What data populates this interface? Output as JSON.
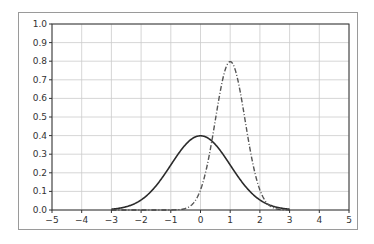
{
  "chart_data": {
    "type": "line",
    "title": "",
    "xlabel": "",
    "ylabel": "",
    "xlim": [
      -5,
      5
    ],
    "ylim": [
      0.0,
      1.0
    ],
    "grid": true,
    "legend": null,
    "xticks": [
      -5,
      -4,
      -3,
      -2,
      -1,
      0,
      1,
      2,
      3,
      4,
      5
    ],
    "yticks": [
      0.0,
      0.1,
      0.2,
      0.3,
      0.4,
      0.5,
      0.6,
      0.7,
      0.8,
      0.9,
      1.0
    ],
    "xtick_labels": [
      "−5",
      "−4",
      "−3",
      "−2",
      "−1",
      "0",
      "1",
      "2",
      "3",
      "4",
      "5"
    ],
    "ytick_labels": [
      "0.0",
      "0.1",
      "0.2",
      "0.3",
      "0.4",
      "0.5",
      "0.6",
      "0.7",
      "0.8",
      "0.9",
      "1.0"
    ],
    "x": [
      -3.0,
      -2.5,
      -2.0,
      -1.5,
      -1.0,
      -0.5,
      0.0,
      0.25,
      0.5,
      0.75,
      1.0,
      1.25,
      1.5,
      2.0,
      2.5,
      3.0
    ],
    "series": [
      {
        "name": "normal(0,1)",
        "style": "solid",
        "color": "#2b2b2b",
        "values": [
          0.004,
          0.018,
          0.054,
          0.13,
          0.242,
          0.352,
          0.399,
          0.387,
          0.352,
          0.301,
          0.242,
          0.183,
          0.13,
          0.054,
          0.018,
          0.004
        ]
      },
      {
        "name": "normal(1,0.5)",
        "style": "dashdot",
        "color": "#555555",
        "values": [
          0.0,
          0.0,
          0.0,
          0.0,
          0.003,
          0.009,
          0.108,
          0.262,
          0.484,
          0.704,
          0.798,
          0.704,
          0.484,
          0.108,
          0.009,
          0.0
        ]
      }
    ]
  },
  "colors": {
    "grid": "#cccccc",
    "axes": "#333333",
    "frame": "#9a9a9a"
  }
}
